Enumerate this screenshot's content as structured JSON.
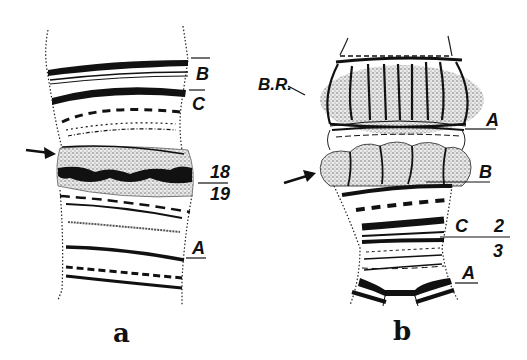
{
  "figure": {
    "panels": [
      {
        "id": "a",
        "caption": "a",
        "labels": {
          "band_B": "B",
          "band_C": "C",
          "division_upper": "18",
          "division_lower": "19",
          "band_A": "A"
        },
        "arrow": "puff-indicator"
      },
      {
        "id": "b",
        "caption": "b",
        "labels": {
          "balbiani_ring": "B.R.",
          "band_A_top": "A",
          "band_B": "B",
          "band_C": "C",
          "division_upper": "2",
          "division_lower": "3",
          "band_A_bottom": "A"
        },
        "arrow": "puff-indicator"
      }
    ],
    "colors": {
      "ink": "#111111",
      "background": "#ffffff",
      "stipple": "#b0b0b0"
    }
  }
}
